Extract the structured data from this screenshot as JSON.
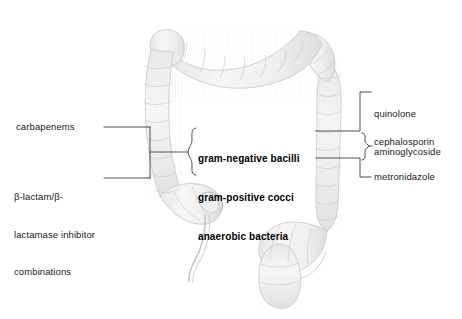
{
  "figure": {
    "kind": "anatomical-diagram",
    "illustration_name": "colon-illustration",
    "colors": {
      "background": "#ffffff",
      "organ_fill": "#f2f2f2",
      "organ_outline": "#c9c9c9",
      "organ_shade": "#e2e2e2",
      "leader_line": "#3c3c3c",
      "text": "#1a1a1a",
      "text_emphasis": "#000000"
    }
  },
  "labels": {
    "left": {
      "carbapenems": "carbapenems",
      "beta_lactam_line1": "β-lactam/β-",
      "beta_lactam_line2": "lactamase inhibitor",
      "beta_lactam_line3": "combinations"
    },
    "center": {
      "gram_negative_bacilli": "gram-negative bacilli",
      "gram_positive_cocci": "gram-positive cocci",
      "anaerobic_bacteria": "anaerobic bacteria"
    },
    "right": {
      "quinolone": "quinolone",
      "aminoglycoside": "aminoglycoside",
      "cephalosporin": "cephalosporin",
      "metronidazole": "metronidazole"
    }
  }
}
